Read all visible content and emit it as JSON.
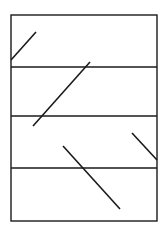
{
  "diagram": {
    "frame": {
      "x": 11,
      "y": 15,
      "width": 146,
      "height": 206
    },
    "horizontal_lines_y": [
      67,
      116,
      168
    ],
    "segments": [
      {
        "x1": 11,
        "y1": 60,
        "x2": 36,
        "y2": 32
      },
      {
        "x1": 33,
        "y1": 126,
        "x2": 90,
        "y2": 62
      },
      {
        "x1": 63,
        "y1": 146,
        "x2": 120,
        "y2": 209
      },
      {
        "x1": 132,
        "y1": 133,
        "x2": 157,
        "y2": 160
      }
    ],
    "stroke_color": "#1a1a1a"
  }
}
